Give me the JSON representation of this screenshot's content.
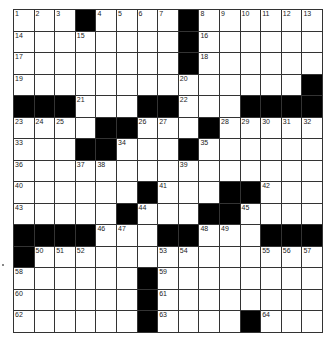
{
  "puzzle": {
    "rows": 15,
    "cols": 15,
    "layout": [
      "...#....#......",
      "........#......",
      "........#......",
      "..............#",
      "###...##...####",
      "....##...#.....",
      "...##...#......",
      "...............",
      "......#...##...",
      ".....#...##....",
      "####...##...###",
      "#..............",
      "......#........",
      "......#........",
      "......#....#..."
    ],
    "numbers": [
      [
        1,
        2,
        3,
        0,
        4,
        5,
        6,
        7,
        0,
        8,
        9,
        10,
        11,
        12,
        13
      ],
      [
        14,
        0,
        0,
        15,
        0,
        0,
        0,
        0,
        0,
        16,
        0,
        0,
        0,
        0,
        0
      ],
      [
        17,
        0,
        0,
        0,
        0,
        0,
        0,
        0,
        0,
        18,
        0,
        0,
        0,
        0,
        0
      ],
      [
        19,
        0,
        0,
        0,
        0,
        0,
        0,
        0,
        20,
        0,
        0,
        0,
        0,
        0,
        0
      ],
      [
        0,
        0,
        0,
        21,
        0,
        0,
        0,
        0,
        22,
        0,
        0,
        0,
        0,
        0,
        0
      ],
      [
        23,
        24,
        25,
        0,
        0,
        0,
        26,
        27,
        0,
        0,
        28,
        29,
        30,
        31,
        32
      ],
      [
        33,
        0,
        0,
        0,
        0,
        34,
        0,
        0,
        0,
        35,
        0,
        0,
        0,
        0,
        0
      ],
      [
        36,
        0,
        0,
        37,
        38,
        0,
        0,
        0,
        39,
        0,
        0,
        0,
        0,
        0,
        0
      ],
      [
        40,
        0,
        0,
        0,
        0,
        0,
        0,
        41,
        0,
        0,
        0,
        0,
        42,
        0,
        0
      ],
      [
        43,
        0,
        0,
        0,
        0,
        0,
        44,
        0,
        0,
        0,
        0,
        45,
        0,
        0,
        0
      ],
      [
        0,
        0,
        0,
        0,
        46,
        47,
        0,
        0,
        0,
        48,
        49,
        0,
        0,
        0,
        0
      ],
      [
        0,
        50,
        51,
        52,
        0,
        0,
        0,
        53,
        54,
        0,
        0,
        0,
        55,
        56,
        57
      ],
      [
        58,
        0,
        0,
        0,
        0,
        0,
        0,
        59,
        0,
        0,
        0,
        0,
        0,
        0,
        0
      ],
      [
        60,
        0,
        0,
        0,
        0,
        0,
        0,
        61,
        0,
        0,
        0,
        0,
        0,
        0,
        0
      ],
      [
        62,
        0,
        0,
        0,
        0,
        0,
        0,
        63,
        0,
        0,
        0,
        0,
        64,
        0,
        0
      ]
    ]
  }
}
